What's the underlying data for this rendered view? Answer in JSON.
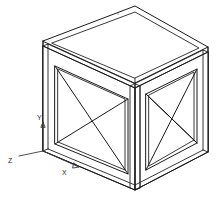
{
  "drawing": {
    "title": "Isometric wireframe box with cross-braced side panels",
    "background_color": "#ffffff",
    "line_color": "#1a1a1a",
    "axis_color": "#3a3a3a",
    "width": 220,
    "height": 201
  },
  "axes": {
    "origin_label": "",
    "items": [
      {
        "id": "x",
        "label": "X",
        "label_x": 64,
        "label_y": 172,
        "arrow_from": [
          43,
          151
        ],
        "arrow_to": [
          78,
          166
        ]
      },
      {
        "id": "y",
        "label": "Y",
        "label_x": 36,
        "label_y": 121,
        "arrow_from": [
          43,
          151
        ],
        "arrow_to": [
          43,
          123
        ]
      },
      {
        "id": "z",
        "label": "Z",
        "label_x": 9,
        "label_y": 160,
        "arrow_from": [
          43,
          151
        ],
        "arrow_to": [
          20,
          156
        ]
      }
    ]
  },
  "geometry": {
    "outer_box": {
      "top_front": [
        135,
        6
      ],
      "top_left": [
        43,
        41
      ],
      "top_right": [
        208,
        47
      ],
      "top_back": [
        118,
        14
      ],
      "bottom_front": [
        135,
        190
      ],
      "bottom_left": [
        43,
        151
      ],
      "bottom_right": [
        208,
        152
      ],
      "plate_thickness": 5
    },
    "left_panel": {
      "corners": [
        [
          55,
          66
        ],
        [
          128,
          93
        ],
        [
          128,
          174
        ],
        [
          55,
          144
        ]
      ],
      "brace_pairs": [
        [
          [
            55,
            66
          ],
          [
            128,
            174
          ]
        ],
        [
          [
            128,
            93
          ],
          [
            55,
            144
          ]
        ]
      ]
    },
    "right_panel": {
      "corners": [
        [
          146,
          85
        ],
        [
          197,
          66
        ],
        [
          197,
          146
        ],
        [
          146,
          170
        ]
      ],
      "brace_pairs": [
        [
          [
            146,
            85
          ],
          [
            197,
            146
          ]
        ],
        [
          [
            197,
            66
          ],
          [
            146,
            170
          ]
        ]
      ]
    }
  }
}
